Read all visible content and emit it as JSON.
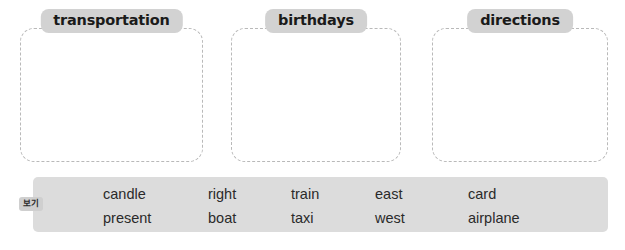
{
  "worksheet": {
    "categories": [
      {
        "id": "transportation",
        "label": "transportation"
      },
      {
        "id": "birthdays",
        "label": "birthdays"
      },
      {
        "id": "directions",
        "label": "directions"
      }
    ],
    "word_bank": {
      "tag_label": "보기",
      "columns": [
        {
          "words": [
            "candle",
            "present"
          ]
        },
        {
          "words": [
            "right",
            "boat"
          ]
        },
        {
          "words": [
            "train",
            "taxi"
          ]
        },
        {
          "words": [
            "east",
            "west"
          ]
        },
        {
          "words": [
            "card",
            "airplane"
          ]
        }
      ]
    },
    "colors": {
      "label_background": "#d2d2d2",
      "word_bank_background": "#dcdcdc",
      "tag_background": "#cfcfcf",
      "dashed_border": "#b9b9b9",
      "text": "#2a2a2a",
      "page_background": "#ffffff"
    }
  }
}
